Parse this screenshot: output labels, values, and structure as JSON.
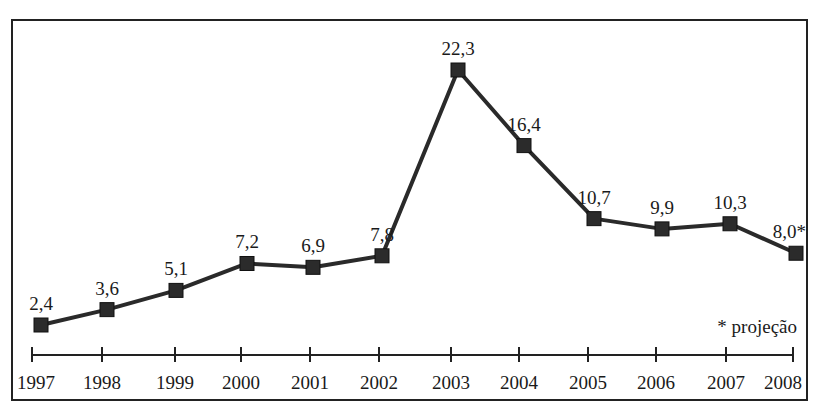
{
  "chart_data": {
    "type": "line",
    "title": "",
    "xlabel": "",
    "ylabel": "",
    "x": [
      "1997",
      "1998",
      "1999",
      "2000",
      "2001",
      "2002",
      "2003",
      "2004",
      "2005",
      "2006",
      "2007",
      "2008"
    ],
    "series": [
      {
        "name": "",
        "values": [
          2.4,
          3.6,
          5.1,
          7.2,
          6.9,
          7.8,
          22.3,
          16.4,
          10.7,
          9.9,
          10.3,
          8.0
        ],
        "labels": [
          "2,4",
          "3,6",
          "5,1",
          "7,2",
          "6,9",
          "7,8",
          "22,3",
          "16,4",
          "10,7",
          "9,9",
          "10,3",
          "8,0*"
        ]
      }
    ],
    "annotations": [
      "* projeção"
    ],
    "grid": false,
    "legend": "none",
    "marker": "square",
    "line_color": "#2a2a2a"
  },
  "footnote": "* projeção"
}
